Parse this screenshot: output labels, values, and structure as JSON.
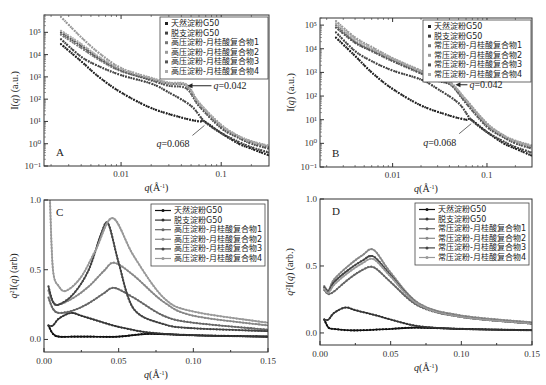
{
  "chart_data": [
    {
      "panel": "A",
      "type": "scatter",
      "xscale": "log",
      "yscale": "log",
      "xlabel": "q(Å⁻¹)",
      "ylabel": "I(q) (a.u.)",
      "xlim": [
        0.0017,
        0.3
      ],
      "ylim": [
        0.1,
        600000
      ],
      "xticks": [
        "0.01",
        "0.1"
      ],
      "yticks": [
        "10⁻¹",
        "10⁰",
        "10¹",
        "10²",
        "10³",
        "10⁴",
        "10⁵"
      ],
      "legend": [
        "天然淀粉G50",
        "脱支淀粉G50",
        "高压淀粉-月桂酸复合物1",
        "高压淀粉-月桂酸复合物2",
        "高压淀粉-月桂酸复合物3",
        "高压淀粉-月桂酸复合物4"
      ],
      "annotations": [
        {
          "text": "q=0.042",
          "x": 0.042,
          "y": 400
        },
        {
          "text": "q=0.068",
          "x": 0.068,
          "y": 10
        }
      ],
      "series": [
        {
          "name": "天然淀粉G50",
          "color": "#222222",
          "x": [
            0.0025,
            0.004,
            0.006,
            0.01,
            0.02,
            0.04,
            0.06,
            0.068,
            0.1,
            0.15,
            0.2,
            0.3
          ],
          "y": [
            30000,
            5000,
            1000,
            200,
            40,
            15,
            10,
            10,
            3,
            1,
            0.6,
            0.3
          ]
        },
        {
          "name": "脱支淀粉G50",
          "color": "#444444",
          "x": [
            0.0025,
            0.004,
            0.006,
            0.01,
            0.02,
            0.03,
            0.05,
            0.068,
            0.1,
            0.15,
            0.2,
            0.3
          ],
          "y": [
            50000,
            8000,
            3000,
            1200,
            500,
            200,
            50,
            10,
            3,
            1.2,
            0.7,
            0.4
          ]
        },
        {
          "name": "高压淀粉-月桂酸复合物1",
          "color": "#777777",
          "x": [
            0.0025,
            0.004,
            0.006,
            0.01,
            0.02,
            0.03,
            0.045,
            0.06,
            0.1,
            0.15,
            0.2,
            0.3
          ],
          "y": [
            80000,
            20000,
            6000,
            1800,
            800,
            500,
            400,
            60,
            6,
            2,
            1.2,
            0.7
          ]
        },
        {
          "name": "高压淀粉-月桂酸复合物2",
          "color": "#999999",
          "x": [
            0.0025,
            0.004,
            0.006,
            0.01,
            0.02,
            0.03,
            0.045,
            0.06,
            0.1,
            0.15,
            0.2,
            0.3
          ],
          "y": [
            500000,
            60000,
            12000,
            2500,
            900,
            550,
            450,
            70,
            7,
            2.2,
            1.3,
            0.8
          ]
        },
        {
          "name": "高压淀粉-月桂酸复合物3",
          "color": "#555555",
          "x": [
            0.0025,
            0.004,
            0.006,
            0.01,
            0.02,
            0.03,
            0.045,
            0.06,
            0.1,
            0.15,
            0.2,
            0.3
          ],
          "y": [
            100000,
            25000,
            7000,
            2000,
            700,
            400,
            300,
            50,
            5,
            1.8,
            1,
            0.6
          ]
        },
        {
          "name": "高压淀粉-月桂酸复合物4",
          "color": "#aaaaaa",
          "x": [
            0.0025,
            0.004,
            0.006,
            0.01,
            0.02,
            0.03,
            0.045,
            0.06,
            0.1,
            0.15,
            0.2,
            0.3
          ],
          "y": [
            120000,
            30000,
            8000,
            2200,
            850,
            520,
            420,
            65,
            6.5,
            2.1,
            1.2,
            0.75
          ]
        }
      ]
    },
    {
      "panel": "B",
      "type": "scatter",
      "xscale": "log",
      "yscale": "log",
      "xlabel": "q(Å⁻¹)",
      "ylabel": "I(q) (a.u.)",
      "xlim": [
        0.0017,
        0.3
      ],
      "ylim": [
        0.1,
        200000
      ],
      "xticks": [
        "0.01",
        "0.1"
      ],
      "yticks": [
        "10⁻¹",
        "10⁰",
        "10¹",
        "10²",
        "10³",
        "10⁴",
        "10⁵"
      ],
      "legend": [
        "天然淀粉G50",
        "脱支淀粉G50",
        "常压淀粉-月桂酸复合物1",
        "常压淀粉-月桂酸复合物2",
        "常压淀粉-月桂酸复合物3",
        "常压淀粉-月桂酸复合物4"
      ],
      "annotations": [
        {
          "text": "q=0.042",
          "x": 0.042,
          "y": 300
        },
        {
          "text": "q=0.068",
          "x": 0.068,
          "y": 10
        }
      ],
      "series": [
        {
          "name": "天然淀粉G50",
          "color": "#222222",
          "x": [
            0.0025,
            0.004,
            0.006,
            0.01,
            0.02,
            0.04,
            0.06,
            0.068,
            0.1,
            0.15,
            0.2,
            0.3
          ],
          "y": [
            30000,
            5000,
            1000,
            200,
            40,
            15,
            10,
            10,
            3,
            1,
            0.6,
            0.3
          ]
        },
        {
          "name": "脱支淀粉G50",
          "color": "#444444",
          "x": [
            0.0025,
            0.004,
            0.006,
            0.01,
            0.02,
            0.03,
            0.05,
            0.068,
            0.1,
            0.15,
            0.2,
            0.3
          ],
          "y": [
            50000,
            8000,
            3000,
            1200,
            500,
            200,
            50,
            10,
            3,
            1.2,
            0.7,
            0.4
          ]
        },
        {
          "name": "常压淀粉-月桂酸复合物1",
          "color": "#777777",
          "x": [
            0.0025,
            0.004,
            0.006,
            0.01,
            0.02,
            0.03,
            0.042,
            0.06,
            0.1,
            0.15,
            0.2,
            0.3
          ],
          "y": [
            100000,
            20000,
            9000,
            3500,
            1000,
            500,
            300,
            60,
            6,
            2,
            1.2,
            0.7
          ]
        },
        {
          "name": "常压淀粉-月桂酸复合物2",
          "color": "#999999",
          "x": [
            0.0025,
            0.004,
            0.006,
            0.01,
            0.02,
            0.03,
            0.042,
            0.06,
            0.1,
            0.15,
            0.2,
            0.3
          ],
          "y": [
            150000,
            30000,
            12000,
            4000,
            1200,
            600,
            350,
            70,
            7,
            2.2,
            1.3,
            0.8
          ]
        },
        {
          "name": "常压淀粉-月桂酸复合物3",
          "color": "#555555",
          "x": [
            0.0025,
            0.004,
            0.006,
            0.01,
            0.02,
            0.03,
            0.042,
            0.06,
            0.1,
            0.15,
            0.2,
            0.3
          ],
          "y": [
            80000,
            18000,
            8000,
            3000,
            900,
            450,
            280,
            50,
            5,
            1.8,
            1,
            0.6
          ]
        },
        {
          "name": "常压淀粉-月桂酸复合物4",
          "color": "#aaaaaa",
          "x": [
            0.0025,
            0.004,
            0.006,
            0.01,
            0.02,
            0.03,
            0.042,
            0.06,
            0.1,
            0.15,
            0.2,
            0.3
          ],
          "y": [
            120000,
            25000,
            10000,
            3800,
            1100,
            550,
            320,
            65,
            6.5,
            2.1,
            1.2,
            0.75
          ]
        }
      ]
    },
    {
      "panel": "C",
      "type": "line",
      "xlabel": "q(Å⁻¹)",
      "ylabel": "q²I(q) (arb)",
      "xlim": [
        0,
        0.15
      ],
      "ylim": [
        -0.09,
        1.0
      ],
      "xticks": [
        "0.00",
        "0.05",
        "0.10",
        "0.15"
      ],
      "yticks": [
        "0.0",
        "0.5",
        "1.0"
      ],
      "legend": [
        "天然淀粉G50",
        "脱支淀粉G50",
        "高压淀粉-月桂酸复合物1",
        "高压淀粉-月桂酸复合物2",
        "高压淀粉-月桂酸复合物3",
        "高压淀粉-月桂酸复合物4"
      ],
      "series": [
        {
          "name": "天然淀粉G50",
          "color": "#111111",
          "x": [
            0.003,
            0.006,
            0.01,
            0.02,
            0.03,
            0.05,
            0.07,
            0.1,
            0.15
          ],
          "y": [
            0.1,
            0.04,
            0.02,
            0.02,
            0.02,
            0.02,
            0.04,
            0.03,
            0.02
          ]
        },
        {
          "name": "脱支淀粉G50",
          "color": "#333333",
          "x": [
            0.003,
            0.006,
            0.01,
            0.018,
            0.025,
            0.04,
            0.05,
            0.07,
            0.1,
            0.15
          ],
          "y": [
            0.1,
            0.1,
            0.15,
            0.19,
            0.17,
            0.12,
            0.09,
            0.05,
            0.03,
            0.02
          ]
        },
        {
          "name": "高压淀粉-月桂酸复合物1",
          "color": "#666666",
          "x": [
            0.003,
            0.006,
            0.01,
            0.02,
            0.03,
            0.04,
            0.047,
            0.06,
            0.08,
            0.1,
            0.15
          ],
          "y": [
            0.3,
            0.22,
            0.19,
            0.21,
            0.26,
            0.33,
            0.37,
            0.3,
            0.17,
            0.12,
            0.07
          ]
        },
        {
          "name": "高压淀粉-月桂酸复合物2",
          "color": "#888888",
          "x": [
            0.003,
            0.006,
            0.01,
            0.02,
            0.03,
            0.04,
            0.047,
            0.06,
            0.08,
            0.1,
            0.15
          ],
          "y": [
            0.35,
            0.27,
            0.25,
            0.3,
            0.38,
            0.49,
            0.55,
            0.46,
            0.27,
            0.17,
            0.1
          ]
        },
        {
          "name": "高压淀粉-月桂酸复合物3",
          "color": "#444444",
          "x": [
            0.003,
            0.006,
            0.01,
            0.02,
            0.03,
            0.038,
            0.043,
            0.05,
            0.06,
            0.08,
            0.1,
            0.15
          ],
          "y": [
            0.38,
            0.27,
            0.25,
            0.33,
            0.5,
            0.75,
            0.83,
            0.55,
            0.22,
            0.11,
            0.08,
            0.06
          ]
        },
        {
          "name": "高压淀粉-月桂酸复合物4",
          "color": "#999999",
          "x": [
            0.004,
            0.006,
            0.01,
            0.015,
            0.025,
            0.035,
            0.046,
            0.06,
            0.08,
            0.1,
            0.15
          ],
          "y": [
            1.0,
            0.5,
            0.38,
            0.35,
            0.45,
            0.65,
            0.87,
            0.6,
            0.3,
            0.2,
            0.12
          ]
        }
      ]
    },
    {
      "panel": "D",
      "type": "line",
      "xlabel": "q(Å⁻¹)",
      "ylabel": "q²I(q) (arb.)",
      "xlim": [
        0,
        0.15
      ],
      "ylim": [
        -0.09,
        1.0
      ],
      "xticks": [
        "0.00",
        "0.05",
        "0.10",
        "0.15"
      ],
      "yticks": [
        "0.0",
        "0.5",
        "1.0"
      ],
      "legend": [
        "天然淀粉G50",
        "脱支淀粉G50",
        "常压淀粉-月桂酸复合物1",
        "常压淀粉-月桂酸复合物2",
        "常压淀粉-月桂酸复合物3",
        "常压淀粉-月桂酸复合物4"
      ],
      "series": [
        {
          "name": "天然淀粉G50",
          "color": "#111111",
          "x": [
            0.003,
            0.006,
            0.01,
            0.02,
            0.03,
            0.05,
            0.068,
            0.1,
            0.15
          ],
          "y": [
            0.1,
            0.04,
            0.03,
            0.02,
            0.02,
            0.03,
            0.04,
            0.03,
            0.02
          ]
        },
        {
          "name": "脱支淀粉G50",
          "color": "#333333",
          "x": [
            0.003,
            0.006,
            0.01,
            0.018,
            0.025,
            0.04,
            0.05,
            0.07,
            0.1,
            0.15
          ],
          "y": [
            0.1,
            0.1,
            0.15,
            0.19,
            0.17,
            0.13,
            0.1,
            0.05,
            0.03,
            0.02
          ]
        },
        {
          "name": "常压淀粉-月桂酸复合物1",
          "color": "#666666",
          "x": [
            0.003,
            0.006,
            0.01,
            0.02,
            0.03,
            0.038,
            0.05,
            0.07,
            0.1,
            0.15
          ],
          "y": [
            0.32,
            0.29,
            0.31,
            0.4,
            0.47,
            0.49,
            0.38,
            0.2,
            0.12,
            0.07
          ]
        },
        {
          "name": "常压淀粉-月桂酸复合物2",
          "color": "#888888",
          "x": [
            0.003,
            0.006,
            0.01,
            0.02,
            0.03,
            0.038,
            0.05,
            0.07,
            0.1,
            0.15
          ],
          "y": [
            0.35,
            0.32,
            0.4,
            0.5,
            0.58,
            0.62,
            0.45,
            0.22,
            0.13,
            0.08
          ]
        },
        {
          "name": "常压淀粉-月桂酸复合物3",
          "color": "#444444",
          "x": [
            0.003,
            0.006,
            0.01,
            0.02,
            0.03,
            0.038,
            0.05,
            0.07,
            0.1,
            0.15
          ],
          "y": [
            0.34,
            0.31,
            0.38,
            0.47,
            0.54,
            0.57,
            0.43,
            0.21,
            0.12,
            0.07
          ]
        },
        {
          "name": "常压淀粉-月桂酸复合物4",
          "color": "#999999",
          "x": [
            0.003,
            0.006,
            0.01,
            0.02,
            0.03,
            0.038,
            0.05,
            0.07,
            0.1,
            0.15
          ],
          "y": [
            0.33,
            0.3,
            0.36,
            0.45,
            0.52,
            0.55,
            0.42,
            0.21,
            0.12,
            0.07
          ]
        }
      ]
    }
  ],
  "layout": {
    "panels": [
      {
        "id": "A",
        "left": 44,
        "top": 15,
        "right": 269,
        "bottom": 166
      },
      {
        "id": "B",
        "left": 320,
        "top": 18,
        "right": 532,
        "bottom": 167
      },
      {
        "id": "C",
        "left": 44,
        "top": 200,
        "right": 268,
        "bottom": 352
      },
      {
        "id": "D",
        "left": 320,
        "top": 199,
        "right": 532,
        "bottom": 345
      }
    ]
  }
}
